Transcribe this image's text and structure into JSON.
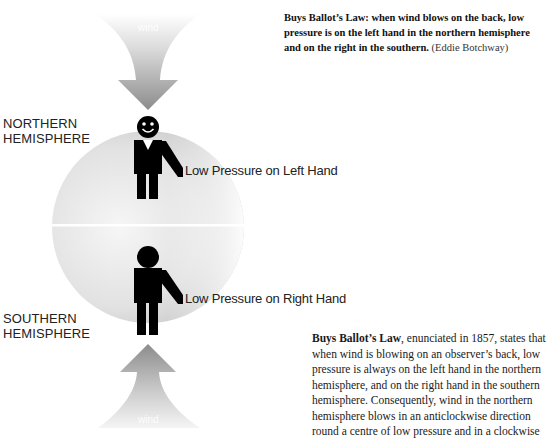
{
  "caption": {
    "bold_text_lines": [
      "Buys Ballot’s Law: when wind blows on the back, low",
      "pressure is on the left hand in the northern hemisphere",
      "and on the right in the southern."
    ],
    "credit": "(Eddie Botchway)"
  },
  "diagram": {
    "top_arrow": {
      "label": "wind",
      "direction": "down"
    },
    "bottom_arrow": {
      "label": "wind",
      "direction": "up"
    },
    "northern": {
      "label_line1": "NORTHERN",
      "label_line2": "HEMISPHERE",
      "pressure_label": "Low Pressure on Left Hand",
      "figure": "person-front-view-smiling"
    },
    "southern": {
      "label_line1": "SOUTHERN",
      "label_line2": "HEMISPHERE",
      "pressure_label": "Low Pressure on Right Hand",
      "figure": "person-back-view"
    },
    "colors": {
      "globe_light": "#f4f4f4",
      "globe_dark": "#bdbdbd",
      "arrow_dark": "#8a8a8a",
      "arrow_light": "#f2f2f2",
      "figure": "#000000"
    }
  },
  "body": {
    "lead": "Buys Ballot’s Law",
    "lines": [
      ", enunciated in 1857, states that",
      "when wind is blowing on an observer’s back, low",
      "pressure is always on the left hand in the northern",
      "hemisphere, and on the right hand in the southern",
      "hemisphere. Consequently, wind in the northern",
      "hemisphere blows in an anticlockwise direction",
      "round a centre of low pressure and in a clockwise"
    ]
  }
}
